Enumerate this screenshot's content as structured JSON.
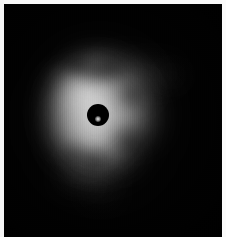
{
  "figure": {
    "kind": "coronagraphic-astronomical-image",
    "title": "",
    "width_px": 226,
    "height_px": 237,
    "background_color": "#010101",
    "frame_color": "#f6f6f6",
    "colormap": "grayscale"
  },
  "field": {
    "sky_background_color": "#010101",
    "peak_color": "#ffffff",
    "midtone_color": "#b8b8b8",
    "faint_color": "#3c3c3c"
  },
  "occulter": {
    "label": "occulting-spot",
    "center_x": 98,
    "center_y": 115,
    "radius_px": 11,
    "fill_color": "#000000",
    "residual_core": {
      "center_x": 98,
      "center_y": 119,
      "radius_px": 3,
      "peak_color": "#e8e8e8"
    }
  },
  "structures": [
    {
      "name": "inner-bright-halo",
      "cx": 97,
      "cy": 114,
      "rx": 40,
      "ry": 44,
      "brightness": 0.95,
      "color": "#ffffff",
      "blur": 16
    },
    {
      "name": "upper-left-bright-arc",
      "cx": 84,
      "cy": 92,
      "rx": 26,
      "ry": 20,
      "brightness": 0.92,
      "color": "#f4f4f4",
      "blur": 13
    },
    {
      "name": "northern-clump",
      "cx": 96,
      "cy": 72,
      "rx": 22,
      "ry": 15,
      "brightness": 0.62,
      "color": "#cfcfcf",
      "blur": 14
    },
    {
      "name": "north-east-lobe",
      "cx": 126,
      "cy": 80,
      "rx": 20,
      "ry": 16,
      "brightness": 0.55,
      "color": "#c4c4c4",
      "blur": 15
    },
    {
      "name": "eastern-arc",
      "cx": 130,
      "cy": 114,
      "rx": 22,
      "ry": 22,
      "brightness": 0.6,
      "color": "#cacaca",
      "blur": 16
    },
    {
      "name": "southern-bright-extension",
      "cx": 100,
      "cy": 143,
      "rx": 24,
      "ry": 20,
      "brightness": 0.72,
      "color": "#dedede",
      "blur": 15
    },
    {
      "name": "south-west-ridge",
      "cx": 78,
      "cy": 135,
      "rx": 18,
      "ry": 22,
      "brightness": 0.6,
      "color": "#c8c8c8",
      "blur": 15
    },
    {
      "name": "western-rim",
      "cx": 70,
      "cy": 110,
      "rx": 16,
      "ry": 30,
      "brightness": 0.5,
      "color": "#bdbdbd",
      "blur": 16
    },
    {
      "name": "north-east-faint-wisp",
      "cx": 152,
      "cy": 74,
      "rx": 26,
      "ry": 9,
      "brightness": 0.26,
      "color": "#8a8a8a",
      "blur": 13
    },
    {
      "name": "far-north-east-tip",
      "cx": 172,
      "cy": 76,
      "rx": 14,
      "ry": 6,
      "brightness": 0.16,
      "color": "#6c6c6c",
      "blur": 11
    },
    {
      "name": "west-faint-streak",
      "cx": 55,
      "cy": 73,
      "rx": 10,
      "ry": 3,
      "brightness": 0.2,
      "color": "#707070",
      "blur": 7
    },
    {
      "name": "south-tail-upper",
      "cx": 92,
      "cy": 168,
      "rx": 24,
      "ry": 13,
      "brightness": 0.28,
      "color": "#909090",
      "blur": 14
    },
    {
      "name": "south-west-tail",
      "cx": 76,
      "cy": 176,
      "rx": 15,
      "ry": 12,
      "brightness": 0.24,
      "color": "#838383",
      "blur": 13
    },
    {
      "name": "south-tail-lower",
      "cx": 101,
      "cy": 190,
      "rx": 16,
      "ry": 12,
      "brightness": 0.2,
      "color": "#777777",
      "blur": 13
    },
    {
      "name": "south-east-faint-spur",
      "cx": 124,
      "cy": 160,
      "rx": 16,
      "ry": 10,
      "brightness": 0.18,
      "color": "#6e6e6e",
      "blur": 13
    },
    {
      "name": "outer-diffuse-envelope",
      "cx": 100,
      "cy": 120,
      "rx": 58,
      "ry": 70,
      "brightness": 0.17,
      "color": "#5a5a5a",
      "blur": 26
    }
  ],
  "dark_lanes": [
    {
      "name": "northern-dust-lane",
      "cx": 104,
      "cy": 70,
      "rx": 24,
      "ry": 8,
      "opacity": 0.88,
      "rotation_deg": -8,
      "blur": 8
    },
    {
      "name": "north-west-dust-notch",
      "cx": 78,
      "cy": 66,
      "rx": 13,
      "ry": 7,
      "opacity": 0.7,
      "rotation_deg": 12,
      "blur": 7
    },
    {
      "name": "eastern-dust-gap",
      "cx": 131,
      "cy": 96,
      "rx": 11,
      "ry": 10,
      "opacity": 0.62,
      "rotation_deg": 0,
      "blur": 8
    },
    {
      "name": "south-east-dark-wedge",
      "cx": 128,
      "cy": 141,
      "rx": 16,
      "ry": 12,
      "opacity": 0.66,
      "rotation_deg": 20,
      "blur": 9
    },
    {
      "name": "south-central-dark-notch",
      "cx": 95,
      "cy": 160,
      "rx": 16,
      "ry": 8,
      "opacity": 0.72,
      "rotation_deg": -6,
      "blur": 8
    },
    {
      "name": "south-west-dark-gap",
      "cx": 74,
      "cy": 154,
      "rx": 10,
      "ry": 9,
      "opacity": 0.55,
      "rotation_deg": 0,
      "blur": 8
    }
  ]
}
